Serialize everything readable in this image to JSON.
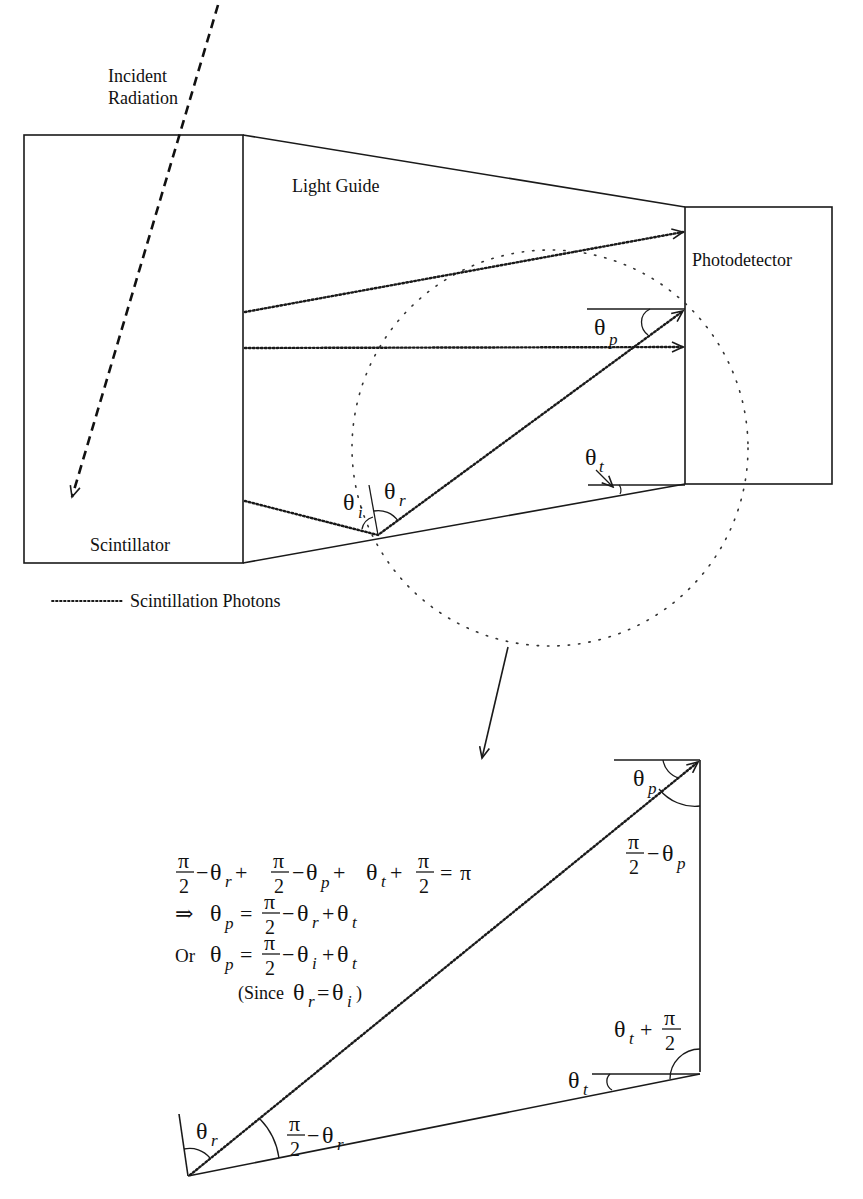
{
  "labels": {
    "incident_line1": "Incident",
    "incident_line2": "Radiation",
    "light_guide": "Light Guide",
    "photodetector": "Photodetector",
    "scintillator": "Scintillator",
    "legend": "Scintillation Photons"
  },
  "angles": {
    "theta": "θ",
    "sub_p": "p",
    "sub_t": "t",
    "sub_i": "i",
    "sub_r": "r",
    "pi": "π",
    "two": "2",
    "minus": "−",
    "plus": "+"
  },
  "equations": {
    "line1": "π/2 − θr + π/2 − θp + θt + π/2 = π",
    "line2_prefix": "⇒",
    "line2": "θp = π/2 − θr + θt",
    "line3_prefix": "Or",
    "line3": "θp = π/2 − θi + θt",
    "line4_open": "(Since",
    "line4_close": ")",
    "equals": "=",
    "rhs_pi": "π"
  },
  "colors": {
    "ink": "#1a1a1a",
    "background": "#ffffff"
  }
}
